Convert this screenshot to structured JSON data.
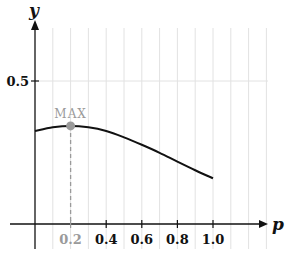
{
  "chart_data": {
    "type": "line",
    "title": "",
    "xlabel": "p",
    "ylabel": "y",
    "xlim": [
      0,
      1.3
    ],
    "ylim": [
      0,
      0.65
    ],
    "x_ticks": [
      "0.2",
      "0.4",
      "0.6",
      "0.8",
      "1.0"
    ],
    "y_ticks": [
      "0.5"
    ],
    "grid": true,
    "series": [
      {
        "name": "curve",
        "x": [
          0.0,
          0.1,
          0.2,
          0.3,
          0.4,
          0.5,
          0.6,
          0.7,
          0.8,
          0.9,
          1.0
        ],
        "values": [
          0.325,
          0.338,
          0.343,
          0.338,
          0.325,
          0.303,
          0.277,
          0.249,
          0.218,
          0.188,
          0.16
        ]
      }
    ],
    "annotations": [
      {
        "text": "MAX",
        "x": 0.2,
        "y": 0.343,
        "highlighted_tick": "0.2"
      }
    ]
  },
  "colors": {
    "curve": "#111111",
    "axis": "#111111",
    "grid": "#e2e2e2",
    "marker": "#9a9a9a",
    "muted_text": "#9a9a9a"
  }
}
